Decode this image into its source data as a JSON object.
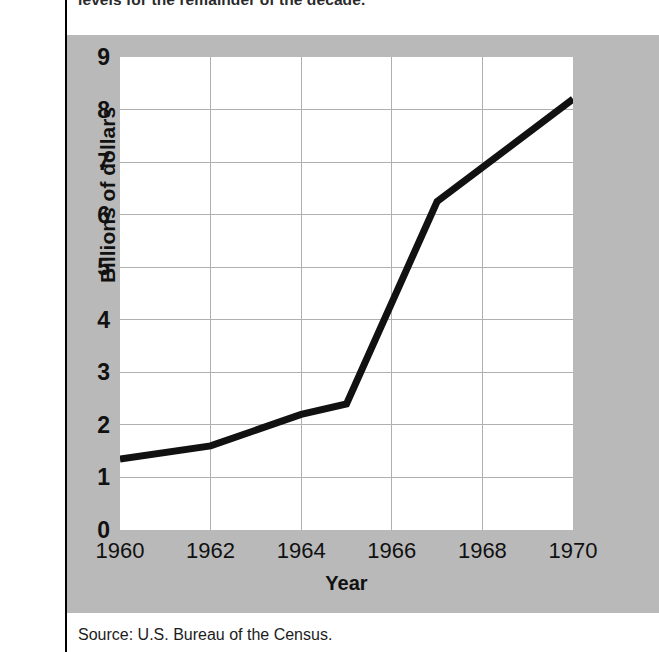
{
  "figure": {
    "caption_top": "levels for the remainder of the decade.",
    "source_note": "Source: U.S. Bureau of the Census.",
    "panel_color": "#b9b9b9",
    "plot_bg": "#ffffff",
    "line_color": "#111111",
    "grid_color": "#b0b0b0"
  },
  "chart_data": {
    "type": "line",
    "title": "",
    "subtitle": "",
    "xlabel": "Year",
    "ylabel": "Billions of dollars",
    "xlim": [
      1960,
      1970
    ],
    "ylim": [
      0,
      9
    ],
    "grid": true,
    "legend": "none",
    "x_ticks": [
      "1960",
      "1962",
      "1964",
      "1966",
      "1968",
      "1970"
    ],
    "y_ticks": [
      "0",
      "1",
      "2",
      "3",
      "4",
      "5",
      "6",
      "7",
      "8",
      "9"
    ],
    "x": [
      1960,
      1962,
      1964,
      1965,
      1967,
      1970
    ],
    "values": [
      1.35,
      1.6,
      2.2,
      2.4,
      6.25,
      8.2
    ],
    "series": [
      {
        "name": "Federal aid to education",
        "points": [
          {
            "x": 1960,
            "y": 1.35
          },
          {
            "x": 1962,
            "y": 1.6
          },
          {
            "x": 1964,
            "y": 2.2
          },
          {
            "x": 1965,
            "y": 2.4
          },
          {
            "x": 1967,
            "y": 6.25
          },
          {
            "x": 1970,
            "y": 8.2
          }
        ]
      }
    ]
  }
}
